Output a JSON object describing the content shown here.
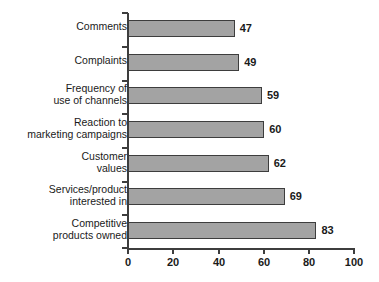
{
  "chart_data": {
    "type": "bar",
    "orientation": "horizontal",
    "title": "",
    "subtitle": "",
    "xlabel": "",
    "ylabel": "",
    "categories": [
      "Comments",
      "Complaints",
      "Frequency of\nuse of channels",
      "Reaction to\nmarketing campaigns",
      "Customer\nvalues",
      "Services/product\ninterested in",
      "Competitive\nproducts owned"
    ],
    "values": [
      47,
      49,
      59,
      60,
      62,
      69,
      83
    ],
    "value_labels": [
      "47",
      "49",
      "59",
      "60",
      "62",
      "69",
      "83"
    ],
    "xlim": [
      0,
      100
    ],
    "xticks": [
      0,
      20,
      40,
      60,
      80,
      100
    ],
    "xtick_labels": [
      "0",
      "20",
      "40",
      "60",
      "80",
      "100"
    ],
    "grid": false,
    "legend": null,
    "bar_color": "#a3a3a3",
    "bar_border_color": "#3d3d3d",
    "axis_color": "#3d3d3d",
    "text_color": "#1a1a1a"
  }
}
